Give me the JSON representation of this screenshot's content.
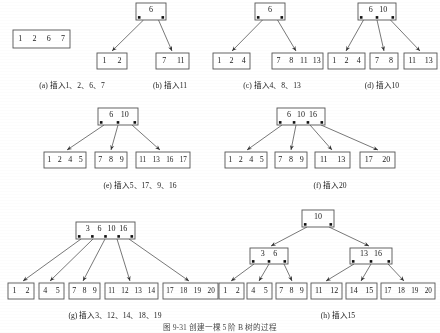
{
  "figure": {
    "caption": "图 9-31  创建一棵 5 阶 B 树的过程",
    "width": 440,
    "height": 333,
    "line_color": "#555555",
    "text_color": "#1a1a1a",
    "dot_color": "#111111"
  },
  "subfigures": [
    {
      "id": "a",
      "caption": "(a) 插入1、2、6、7",
      "caption_x": 72,
      "caption_y": 88,
      "nodes": [
        {
          "name": "root",
          "keys": [
            "1",
            "2",
            "6",
            "7"
          ],
          "x": 13,
          "y": 30,
          "w": 57,
          "h": 18,
          "dots": 0
        }
      ],
      "edges": []
    },
    {
      "id": "b",
      "caption": "(b) 插入11",
      "caption_x": 170,
      "caption_y": 88,
      "nodes": [
        {
          "name": "root",
          "keys": [
            "6"
          ],
          "x": 136,
          "y": 3,
          "w": 30,
          "h": 17,
          "dots": 2
        },
        {
          "name": "leaf-1",
          "keys": [
            "1",
            "2"
          ],
          "x": 97,
          "y": 53,
          "w": 30,
          "h": 16,
          "dots": 0
        },
        {
          "name": "leaf-2",
          "keys": [
            "7",
            "11"
          ],
          "x": 156,
          "y": 53,
          "w": 33,
          "h": 16,
          "dots": 0
        }
      ],
      "edges": [
        {
          "from": [
            143.5,
            20
          ],
          "to": [
            112,
            51
          ]
        },
        {
          "from": [
            158.5,
            20
          ],
          "to": [
            172,
            51
          ]
        }
      ]
    },
    {
      "id": "c",
      "caption": "(c) 插入4、8、13",
      "caption_x": 272,
      "caption_y": 88,
      "nodes": [
        {
          "name": "root",
          "keys": [
            "6"
          ],
          "x": 255,
          "y": 3,
          "w": 30,
          "h": 17,
          "dots": 2
        },
        {
          "name": "leaf-1",
          "keys": [
            "1",
            "2",
            "4"
          ],
          "x": 213,
          "y": 53,
          "w": 37,
          "h": 16,
          "dots": 0
        },
        {
          "name": "leaf-2",
          "keys": [
            "7",
            "8",
            "11",
            "13"
          ],
          "x": 272,
          "y": 53,
          "w": 51,
          "h": 16,
          "dots": 0
        }
      ],
      "edges": [
        {
          "from": [
            262.5,
            20
          ],
          "to": [
            232,
            51
          ]
        },
        {
          "from": [
            277.5,
            20
          ],
          "to": [
            296,
            51
          ]
        }
      ]
    },
    {
      "id": "d",
      "caption": "(d) 插入10",
      "caption_x": 382,
      "caption_y": 88,
      "nodes": [
        {
          "name": "root",
          "keys": [
            "6",
            "10"
          ],
          "x": 358,
          "y": 3,
          "w": 38,
          "h": 17,
          "dots": 3
        },
        {
          "name": "leaf-1",
          "keys": [
            "1",
            "2",
            "4"
          ],
          "x": 328,
          "y": 53,
          "w": 37,
          "h": 16,
          "dots": 0
        },
        {
          "name": "leaf-2",
          "keys": [
            "7",
            "8"
          ],
          "x": 370,
          "y": 53,
          "w": 28,
          "h": 16,
          "dots": 0
        },
        {
          "name": "leaf-3",
          "keys": [
            "11",
            "13"
          ],
          "x": 404,
          "y": 53,
          "w": 33,
          "h": 16,
          "dots": 0
        }
      ],
      "edges": [
        {
          "from": [
            363.5,
            20
          ],
          "to": [
            346,
            51
          ]
        },
        {
          "from": [
            377,
            20
          ],
          "to": [
            384,
            51
          ]
        },
        {
          "from": [
            390.5,
            20
          ],
          "to": [
            420,
            51
          ]
        }
      ]
    },
    {
      "id": "e",
      "caption": "(e) 插入5、17、9、16",
      "caption_x": 140,
      "caption_y": 188,
      "nodes": [
        {
          "name": "root",
          "keys": [
            "6",
            "10"
          ],
          "x": 98,
          "y": 108,
          "w": 40,
          "h": 17,
          "dots": 3
        },
        {
          "name": "leaf-1",
          "keys": [
            "1",
            "2",
            "4",
            "5"
          ],
          "x": 44,
          "y": 152,
          "w": 42,
          "h": 16,
          "dots": 0
        },
        {
          "name": "leaf-2",
          "keys": [
            "7",
            "8",
            "9"
          ],
          "x": 95,
          "y": 152,
          "w": 32,
          "h": 16,
          "dots": 0
        },
        {
          "name": "leaf-3",
          "keys": [
            "11",
            "13",
            "16",
            "17"
          ],
          "x": 136,
          "y": 152,
          "w": 54,
          "h": 16,
          "dots": 0
        }
      ],
      "edges": [
        {
          "from": [
            104,
            125
          ],
          "to": [
            67,
            150
          ]
        },
        {
          "from": [
            118,
            125
          ],
          "to": [
            111,
            150
          ]
        },
        {
          "from": [
            132,
            125
          ],
          "to": [
            160,
            150
          ]
        }
      ]
    },
    {
      "id": "f",
      "caption": "(f) 插入20",
      "caption_x": 330,
      "caption_y": 188,
      "nodes": [
        {
          "name": "root",
          "keys": [
            "6",
            "10",
            "16"
          ],
          "x": 277,
          "y": 108,
          "w": 48,
          "h": 17,
          "dots": 4
        },
        {
          "name": "leaf-1",
          "keys": [
            "1",
            "2",
            "4",
            "5"
          ],
          "x": 225,
          "y": 152,
          "w": 42,
          "h": 16,
          "dots": 0
        },
        {
          "name": "leaf-2",
          "keys": [
            "7",
            "8",
            "9"
          ],
          "x": 275,
          "y": 152,
          "w": 32,
          "h": 16,
          "dots": 0
        },
        {
          "name": "leaf-3",
          "keys": [
            "11",
            "13"
          ],
          "x": 315,
          "y": 152,
          "w": 35,
          "h": 16,
          "dots": 0
        },
        {
          "name": "leaf-4",
          "keys": [
            "17",
            "20"
          ],
          "x": 360,
          "y": 152,
          "w": 35,
          "h": 16,
          "dots": 0
        }
      ],
      "edges": [
        {
          "from": [
            282,
            125
          ],
          "to": [
            247,
            150
          ]
        },
        {
          "from": [
            296,
            125
          ],
          "to": [
            291,
            150
          ]
        },
        {
          "from": [
            310,
            125
          ],
          "to": [
            332,
            150
          ]
        },
        {
          "from": [
            321,
            125
          ],
          "to": [
            378,
            150
          ]
        }
      ]
    },
    {
      "id": "g",
      "caption": "(g) 插入3、12、14、18、19",
      "caption_x": 115,
      "caption_y": 318,
      "nodes": [
        {
          "name": "root",
          "keys": [
            "3",
            "6",
            "10",
            "16"
          ],
          "x": 76,
          "y": 222,
          "w": 59,
          "h": 17,
          "dots": 5
        },
        {
          "name": "leaf-1",
          "keys": [
            "1",
            "2"
          ],
          "x": 8,
          "y": 283,
          "w": 26,
          "h": 16,
          "dots": 0
        },
        {
          "name": "leaf-2",
          "keys": [
            "4",
            "5"
          ],
          "x": 39,
          "y": 283,
          "w": 25,
          "h": 16,
          "dots": 0
        },
        {
          "name": "leaf-3",
          "keys": [
            "7",
            "8",
            "9"
          ],
          "x": 69,
          "y": 283,
          "w": 31,
          "h": 16,
          "dots": 0
        },
        {
          "name": "leaf-4",
          "keys": [
            "11",
            "12",
            "13",
            "14"
          ],
          "x": 105,
          "y": 283,
          "w": 53,
          "h": 16,
          "dots": 0
        },
        {
          "name": "leaf-5",
          "keys": [
            "17",
            "18",
            "19",
            "20"
          ],
          "x": 163,
          "y": 283,
          "w": 55,
          "h": 16,
          "dots": 0
        }
      ],
      "edges": [
        {
          "from": [
            81,
            239
          ],
          "to": [
            23,
            281
          ]
        },
        {
          "from": [
            93,
            239
          ],
          "to": [
            50,
            281
          ]
        },
        {
          "from": [
            105,
            239
          ],
          "to": [
            83,
            281
          ]
        },
        {
          "from": [
            117,
            239
          ],
          "to": [
            130,
            281
          ]
        },
        {
          "from": [
            129,
            239
          ],
          "to": [
            189,
            281
          ]
        }
      ]
    },
    {
      "id": "h",
      "caption": "(h) 插入15",
      "caption_x": 338,
      "caption_y": 318,
      "nodes": [
        {
          "name": "root",
          "keys": [
            "10"
          ],
          "x": 302,
          "y": 210,
          "w": 32,
          "h": 17,
          "dots": 2
        },
        {
          "name": "internal-left",
          "keys": [
            "3",
            "6"
          ],
          "x": 250,
          "y": 248,
          "w": 38,
          "h": 16,
          "dots": 3
        },
        {
          "name": "internal-right",
          "keys": [
            "13",
            "16"
          ],
          "x": 350,
          "y": 248,
          "w": 42,
          "h": 16,
          "dots": 3
        },
        {
          "name": "leaf-1",
          "keys": [
            "1",
            "2"
          ],
          "x": 219,
          "y": 283,
          "w": 25,
          "h": 16,
          "dots": 0
        },
        {
          "name": "leaf-2",
          "keys": [
            "4",
            "5"
          ],
          "x": 247,
          "y": 283,
          "w": 25,
          "h": 16,
          "dots": 0
        },
        {
          "name": "leaf-3",
          "keys": [
            "7",
            "8",
            "9"
          ],
          "x": 276,
          "y": 283,
          "w": 31,
          "h": 16,
          "dots": 0
        },
        {
          "name": "leaf-4",
          "keys": [
            "11",
            "12"
          ],
          "x": 311,
          "y": 283,
          "w": 31,
          "h": 16,
          "dots": 0
        },
        {
          "name": "leaf-5",
          "keys": [
            "14",
            "15"
          ],
          "x": 346,
          "y": 283,
          "w": 31,
          "h": 16,
          "dots": 0
        },
        {
          "name": "leaf-6",
          "keys": [
            "17",
            "18",
            "19",
            "20"
          ],
          "x": 381,
          "y": 283,
          "w": 54,
          "h": 16,
          "dots": 0
        }
      ],
      "edges": [
        {
          "from": [
            307,
            227
          ],
          "to": [
            271,
            246
          ]
        },
        {
          "from": [
            329,
            227
          ],
          "to": [
            369,
            246
          ]
        },
        {
          "from": [
            254,
            264
          ],
          "to": [
            231,
            281
          ]
        },
        {
          "from": [
            269,
            264
          ],
          "to": [
            259,
            281
          ]
        },
        {
          "from": [
            284,
            264
          ],
          "to": [
            292,
            281
          ]
        },
        {
          "from": [
            354,
            264
          ],
          "to": [
            326,
            281
          ]
        },
        {
          "from": [
            371,
            264
          ],
          "to": [
            361,
            281
          ]
        },
        {
          "from": [
            388,
            264
          ],
          "to": [
            404,
            281
          ]
        }
      ]
    }
  ]
}
